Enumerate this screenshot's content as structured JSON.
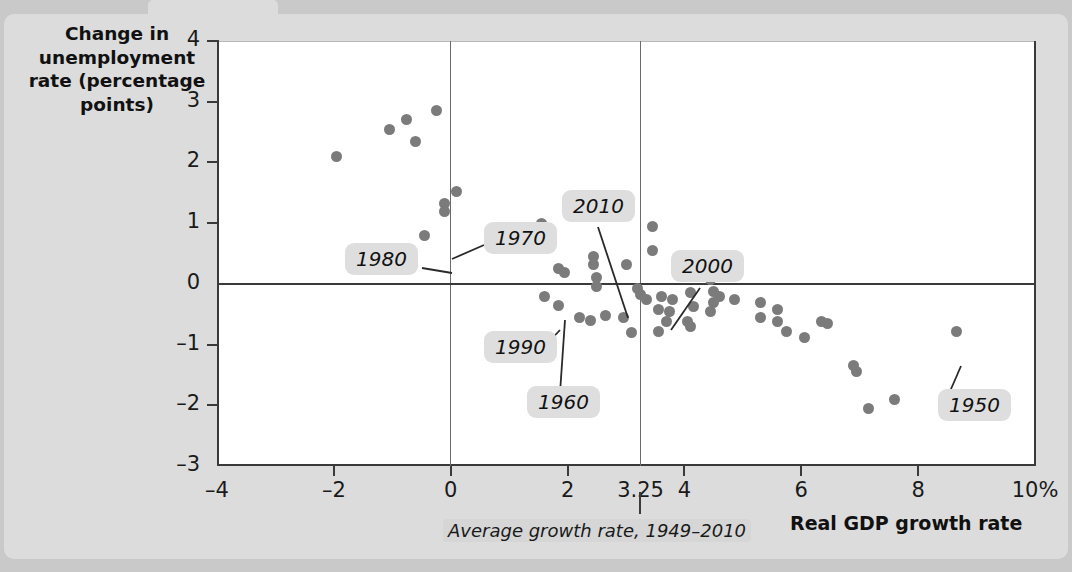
{
  "chart_data": {
    "type": "scatter",
    "title": "",
    "xlabel": "Real GDP growth rate",
    "ylabel": "Change in unemployment rate (percentage points)",
    "xlim": [
      -4,
      10
    ],
    "ylim": [
      -3,
      4
    ],
    "grid": false,
    "legend": "none",
    "x_ticks": [
      "-4",
      "-2",
      "0",
      "2",
      "3.25",
      "4",
      "6",
      "8",
      "10%"
    ],
    "x_tick_values": [
      -4,
      -2,
      0,
      2,
      3.25,
      4,
      6,
      8,
      10
    ],
    "y_ticks": [
      "4",
      "3",
      "2",
      "1",
      "0",
      "-1",
      "-2",
      "-3"
    ],
    "y_tick_values": [
      4,
      3,
      2,
      1,
      0,
      -1,
      -2,
      -3
    ],
    "reference_lines": [
      {
        "orientation": "vertical",
        "value": 0
      },
      {
        "orientation": "vertical",
        "value": 3.25,
        "note": "Average growth rate, 1949-2010"
      },
      {
        "orientation": "horizontal",
        "value": 0
      }
    ],
    "annotations": [
      {
        "label": "1950",
        "x": 8.65,
        "y": -0.78
      },
      {
        "label": "1960",
        "x": 2.5,
        "y": -0.05
      },
      {
        "label": "1970",
        "x": 0.1,
        "y": 1.52
      },
      {
        "label": "1980",
        "x": -0.1,
        "y": 1.28
      },
      {
        "label": "1990",
        "x": 1.85,
        "y": 0.25
      },
      {
        "label": "2000",
        "x": 4.1,
        "y": -0.15
      },
      {
        "label": "2010",
        "x": 3.0,
        "y": 0.32
      }
    ],
    "points": [
      {
        "x": -1.95,
        "y": 2.1
      },
      {
        "x": -1.05,
        "y": 2.55
      },
      {
        "x": -0.75,
        "y": 2.7
      },
      {
        "x": -0.6,
        "y": 2.35
      },
      {
        "x": -0.25,
        "y": 2.85
      },
      {
        "x": -0.1,
        "y": 1.32
      },
      {
        "x": -0.1,
        "y": 1.2
      },
      {
        "x": -0.45,
        "y": 0.8
      },
      {
        "x": 0.1,
        "y": 1.52
      },
      {
        "x": 0.9,
        "y": 0.78
      },
      {
        "x": 1.55,
        "y": 1.0
      },
      {
        "x": 2.05,
        "y": 1.18
      },
      {
        "x": 1.85,
        "y": 0.25
      },
      {
        "x": 1.95,
        "y": 0.18
      },
      {
        "x": 1.6,
        "y": -0.2
      },
      {
        "x": 1.85,
        "y": -0.35
      },
      {
        "x": 2.45,
        "y": 0.45
      },
      {
        "x": 2.45,
        "y": 0.32
      },
      {
        "x": 2.5,
        "y": 0.1
      },
      {
        "x": 2.5,
        "y": -0.05
      },
      {
        "x": 3.0,
        "y": 0.32
      },
      {
        "x": 2.2,
        "y": -0.55
      },
      {
        "x": 2.4,
        "y": -0.6
      },
      {
        "x": 2.65,
        "y": -0.52
      },
      {
        "x": 2.95,
        "y": -0.55
      },
      {
        "x": 3.2,
        "y": -0.08
      },
      {
        "x": 3.25,
        "y": -0.18
      },
      {
        "x": 3.35,
        "y": -0.25
      },
      {
        "x": 3.1,
        "y": -0.8
      },
      {
        "x": 3.45,
        "y": 0.55
      },
      {
        "x": 3.45,
        "y": 0.95
      },
      {
        "x": 3.6,
        "y": -0.2
      },
      {
        "x": 3.55,
        "y": -0.42
      },
      {
        "x": 3.8,
        "y": -0.25
      },
      {
        "x": 3.75,
        "y": -0.45
      },
      {
        "x": 3.7,
        "y": -0.62
      },
      {
        "x": 3.55,
        "y": -0.78
      },
      {
        "x": 4.1,
        "y": -0.15
      },
      {
        "x": 4.15,
        "y": -0.38
      },
      {
        "x": 4.05,
        "y": -0.62
      },
      {
        "x": 4.1,
        "y": -0.7
      },
      {
        "x": 4.45,
        "y": 0.08
      },
      {
        "x": 4.5,
        "y": -0.12
      },
      {
        "x": 4.5,
        "y": -0.3
      },
      {
        "x": 4.45,
        "y": -0.45
      },
      {
        "x": 4.6,
        "y": -0.2
      },
      {
        "x": 4.85,
        "y": -0.25
      },
      {
        "x": 5.3,
        "y": -0.3
      },
      {
        "x": 5.3,
        "y": -0.55
      },
      {
        "x": 5.6,
        "y": -0.42
      },
      {
        "x": 5.6,
        "y": -0.62
      },
      {
        "x": 5.75,
        "y": -0.78
      },
      {
        "x": 6.05,
        "y": -0.88
      },
      {
        "x": 6.35,
        "y": -0.62
      },
      {
        "x": 6.45,
        "y": -0.65
      },
      {
        "x": 6.9,
        "y": -1.35
      },
      {
        "x": 6.95,
        "y": -1.45
      },
      {
        "x": 7.15,
        "y": -2.05
      },
      {
        "x": 7.6,
        "y": -1.9
      },
      {
        "x": 8.65,
        "y": -0.78
      }
    ]
  },
  "labels": {
    "y_title": "Change in unemployment rate (percentage points)",
    "x_title": "Real GDP growth rate",
    "avg_note": "Average growth rate, 1949–2010"
  },
  "callouts": {
    "c1950": "1950",
    "c1960": "1960",
    "c1970": "1970",
    "c1980": "1980",
    "c1990": "1990",
    "c2000": "2000",
    "c2010": "2010"
  },
  "colors": {
    "point": "#7b7b7b",
    "background": "#dcdcdc",
    "plot_background": "#ffffff",
    "axis": "#3a3a3a",
    "callout_bg": "#dedede"
  }
}
